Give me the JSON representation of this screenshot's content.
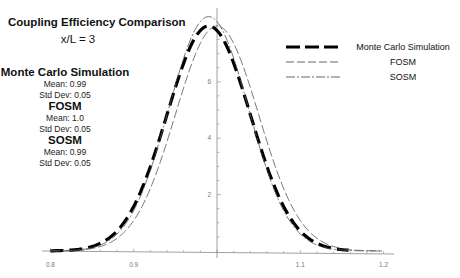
{
  "chart_data": {
    "type": "line",
    "title": "Coupling Efficiency Comparison",
    "subtitle": "x/L = 3",
    "xlabel": "",
    "ylabel": "",
    "xlim": [
      0.79,
      1.21
    ],
    "ylim": [
      0,
      8.5
    ],
    "x_ticks": [
      0.8,
      0.9,
      1.1,
      1.2
    ],
    "y_ticks": [
      2,
      4,
      6
    ],
    "grid": false,
    "legend_position": "upper right",
    "series": [
      {
        "name": "Monte Carlo Simulation",
        "style": "thick-dashed",
        "mean": 0.99,
        "std": 0.05,
        "x": [
          0.8,
          0.85,
          0.9,
          0.93,
          0.95,
          0.97,
          0.99,
          1.01,
          1.03,
          1.05,
          1.08,
          1.1,
          1.15
        ],
        "y": [
          0.06,
          0.54,
          1.57,
          3.29,
          5.31,
          7.37,
          7.98,
          7.37,
          5.31,
          3.29,
          1.57,
          0.68,
          0.05
        ]
      },
      {
        "name": "FOSM",
        "style": "thin-dashed",
        "mean": 1.0,
        "std": 0.05,
        "x": [
          0.8,
          0.85,
          0.9,
          0.94,
          0.96,
          0.98,
          1.0,
          1.02,
          1.04,
          1.06,
          1.1,
          1.15,
          1.2
        ],
        "y": [
          0.003,
          0.09,
          1.08,
          3.88,
          5.79,
          7.36,
          7.98,
          7.36,
          5.79,
          3.88,
          1.08,
          0.09,
          0.003
        ]
      },
      {
        "name": "SOSM",
        "style": "dash-dot",
        "mean": 0.99,
        "std": 0.05,
        "x": [
          0.8,
          0.85,
          0.9,
          0.93,
          0.95,
          0.97,
          0.99,
          1.01,
          1.03,
          1.05,
          1.08,
          1.1,
          1.15
        ],
        "y": [
          0.06,
          0.54,
          1.57,
          3.29,
          5.31,
          7.37,
          7.98,
          7.37,
          5.31,
          3.29,
          1.57,
          0.68,
          0.05
        ]
      }
    ],
    "stats_panel": [
      {
        "name": "Monte Carlo Simulation",
        "mean": "Mean: 0.99",
        "std": "Std Dev: 0.05"
      },
      {
        "name": "FOSM",
        "mean": "Mean: 1.0",
        "std": "Std Dev: 0.05"
      },
      {
        "name": "SOSM",
        "mean": "Mean: 0.99",
        "std": "Std Dev: 0.05"
      }
    ]
  },
  "labels": {
    "title": "Coupling Efficiency Comparison",
    "subtitle": "x/L = 3",
    "x_tick_labels": [
      "0.8",
      "0.9",
      "1.1",
      "1.2"
    ],
    "y_tick_labels": [
      "2",
      "4",
      "6"
    ],
    "legend": [
      "Monte Carlo Simulation",
      "FOSM",
      "SOSM"
    ],
    "stats": [
      {
        "head": "Monte Carlo Simulation",
        "mean": "Mean: 0.99",
        "std": "Std Dev: 0.05"
      },
      {
        "head": "FOSM",
        "mean": "Mean: 1.0",
        "std": "Std Dev: 0.05"
      },
      {
        "head": "SOSM",
        "mean": "Mean: 0.99",
        "std": "Std Dev: 0.05"
      }
    ]
  },
  "colors": {
    "axis": "#888888",
    "mc": "#000000",
    "fosm": "#555555",
    "sosm": "#555555",
    "tick_label": "#777777"
  }
}
